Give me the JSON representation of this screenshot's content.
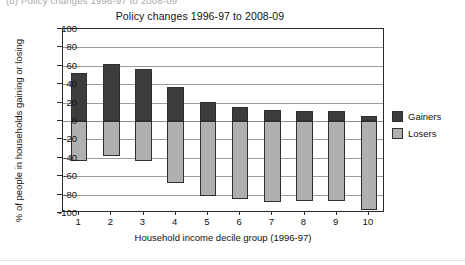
{
  "caption": {
    "text": "(b)   Policy changes 1996-97 to 2008-09"
  },
  "chart_data": {
    "type": "bar",
    "title": "Policy changes 1996-97 to 2008-09",
    "xlabel": "Household income decile group (1996-97)",
    "ylabel": "% of people in households gaining or losing",
    "categories": [
      "1",
      "2",
      "3",
      "4",
      "5",
      "6",
      "7",
      "8",
      "9",
      "10"
    ],
    "series": [
      {
        "name": "Gainers",
        "color": "#3d3d3d",
        "values": [
          52,
          62,
          57,
          37,
          21,
          15,
          12,
          11,
          11,
          5
        ]
      },
      {
        "name": "Losers",
        "color": "#b0b0b0",
        "values": [
          -43,
          -38,
          -43,
          -67,
          -82,
          -85,
          -88,
          -87,
          -87,
          -97
        ]
      }
    ],
    "ylim": [
      -100,
      100
    ],
    "ytick_step": 20,
    "yticks": [
      "100",
      "80",
      "60",
      "40",
      "20",
      "0",
      "-20",
      "-40",
      "-60",
      "-80",
      "-100"
    ],
    "grid": true,
    "legend_position": "right",
    "stacked": true
  },
  "legend": {
    "items": [
      {
        "label": "Gainers",
        "color": "#3d3d3d"
      },
      {
        "label": "Losers",
        "color": "#b0b0b0"
      }
    ]
  }
}
